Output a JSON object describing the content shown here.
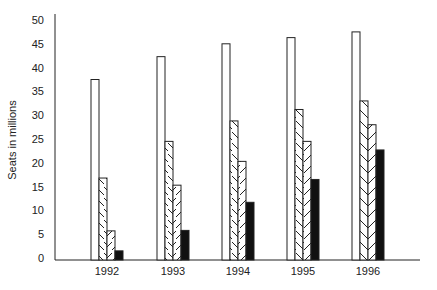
{
  "chart_data": {
    "type": "bar",
    "title": "",
    "xlabel": "",
    "ylabel": "Seats in millions",
    "ylim": [
      0,
      50
    ],
    "yticks": [
      0,
      5,
      10,
      15,
      20,
      25,
      30,
      35,
      40,
      45,
      50
    ],
    "grid": false,
    "legend": null,
    "categories": [
      "1992",
      "1993",
      "1994",
      "1995",
      "1996"
    ],
    "series": [
      {
        "name": "Series 1",
        "pattern": "white",
        "values": [
          37.5,
          42.3,
          45.0,
          46.3,
          47.5
        ]
      },
      {
        "name": "Series 2",
        "pattern": "hatch-backslash",
        "values": [
          16.8,
          24.5,
          28.8,
          31.2,
          33.0
        ]
      },
      {
        "name": "Series 3",
        "pattern": "hatch-slash",
        "values": [
          5.7,
          15.3,
          20.3,
          24.5,
          28.0
        ]
      },
      {
        "name": "Series 4",
        "pattern": "black",
        "values": [
          1.5,
          5.8,
          11.7,
          16.5,
          22.7
        ]
      }
    ]
  },
  "colors": {
    "axis": "#222222",
    "bar_outline": "#222222",
    "white_fill": "#ffffff",
    "black_fill": "#111111"
  }
}
